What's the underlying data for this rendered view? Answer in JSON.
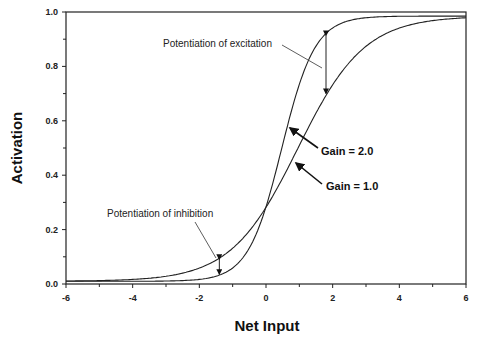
{
  "chart_data": {
    "type": "line",
    "title": "",
    "xlabel": "Net Input",
    "ylabel": "Activation",
    "xlim": [
      -6,
      6
    ],
    "ylim": [
      0,
      1
    ],
    "grid": false,
    "x_ticks": [
      "-6",
      "-4",
      "-2",
      "0",
      "2",
      "4",
      "6"
    ],
    "y_ticks": [
      "0.0",
      "0.2",
      "0.4",
      "0.6",
      "0.8",
      "1.0"
    ],
    "series": [
      {
        "name": "Gain = 1.0",
        "function": "1/(1+exp(-1.0*(x-0.95)))",
        "x": [
          -6,
          -4,
          -2,
          -1,
          0,
          1,
          2,
          4,
          6
        ],
        "values": [
          0.01,
          0.01,
          0.05,
          0.12,
          0.28,
          0.51,
          0.74,
          0.95,
          0.98
        ]
      },
      {
        "name": "Gain = 2.0",
        "function": "1/(1+exp(-2.0*(x-0.47)))",
        "x": [
          -6,
          -4,
          -2,
          -1,
          0,
          1,
          2,
          4,
          6
        ],
        "values": [
          0.01,
          0.01,
          0.01,
          0.05,
          0.28,
          0.74,
          0.96,
          0.99,
          0.99
        ]
      }
    ],
    "annotations": [
      {
        "text": "Potentiation of excitation",
        "x": 1.8
      },
      {
        "text": "Potentiation of inhibition",
        "x": -1.4
      },
      {
        "text": "Gain = 2.0"
      },
      {
        "text": "Gain = 1.0"
      }
    ]
  },
  "labels": {
    "xlabel": "Net Input",
    "ylabel": "Activation",
    "excitation": "Potentiation of excitation",
    "inhibition": "Potentiation of inhibition",
    "gain2": "Gain = 2.0",
    "gain1": "Gain = 1.0"
  }
}
